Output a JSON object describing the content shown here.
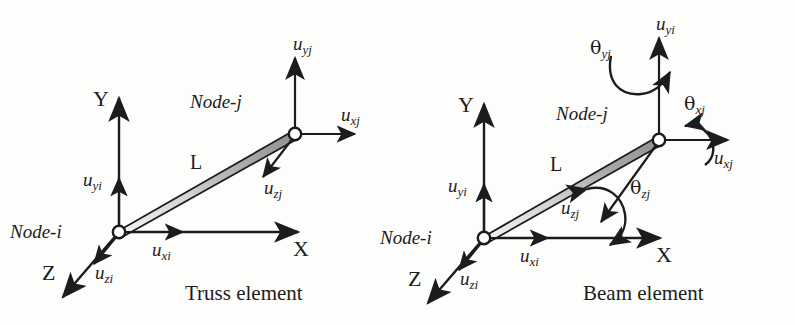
{
  "figure": {
    "background_color": "#fdfdfc",
    "ink_color": "#1c1c1c",
    "element_fill_light": "#f2f2f2",
    "element_fill_dark": "#8d8d8d"
  },
  "truss": {
    "caption": "Truss element",
    "length_label": "L",
    "axes": {
      "x": "X",
      "y": "Y",
      "z": "Z"
    },
    "nodes": {
      "i": "Node-i",
      "j": "Node-j"
    },
    "dofs": [
      {
        "name": "u-xi",
        "base": "u",
        "sub": "xi",
        "node": "i",
        "direction": "x-positive"
      },
      {
        "name": "u-yi",
        "base": "u",
        "sub": "yi",
        "node": "i",
        "direction": "y-positive"
      },
      {
        "name": "u-zi",
        "base": "u",
        "sub": "zi",
        "node": "i",
        "direction": "z-positive"
      },
      {
        "name": "u-xj",
        "base": "u",
        "sub": "xj",
        "node": "j",
        "direction": "x-positive"
      },
      {
        "name": "u-yj",
        "base": "u",
        "sub": "yj",
        "node": "j",
        "direction": "y-positive"
      },
      {
        "name": "u-zj",
        "base": "u",
        "sub": "zj",
        "node": "j",
        "direction": "z-positive"
      }
    ]
  },
  "beam": {
    "caption": "Beam element",
    "length_label": "L",
    "axes": {
      "x": "X",
      "y": "Y",
      "z": "Z"
    },
    "nodes": {
      "i": "Node-i",
      "j": "Node-j"
    },
    "dofs": [
      {
        "name": "u-xi",
        "base": "u",
        "sub": "xi",
        "node": "i",
        "direction": "x-positive"
      },
      {
        "name": "u-yi",
        "base": "u",
        "sub": "yi",
        "node": "i",
        "direction": "y-positive"
      },
      {
        "name": "u-zi",
        "base": "u",
        "sub": "zi",
        "node": "i",
        "direction": "z-positive"
      },
      {
        "name": "u-xj",
        "base": "u",
        "sub": "xj",
        "node": "j",
        "direction": "x-positive"
      },
      {
        "name": "u-yi-top",
        "base": "u",
        "sub": "yi",
        "node": "j",
        "direction": "y-positive"
      },
      {
        "name": "u-zj",
        "base": "u",
        "sub": "zj",
        "node": "j",
        "direction": "z-positive"
      }
    ],
    "rotations": [
      {
        "name": "theta-xj",
        "base": "θ",
        "sub": "xj",
        "node": "j",
        "axis": "x"
      },
      {
        "name": "theta-yj",
        "base": "θ",
        "sub": "yj",
        "node": "j",
        "axis": "y"
      },
      {
        "name": "theta-zj",
        "base": "θ",
        "sub": "zj",
        "node": "j",
        "axis": "z"
      }
    ]
  }
}
